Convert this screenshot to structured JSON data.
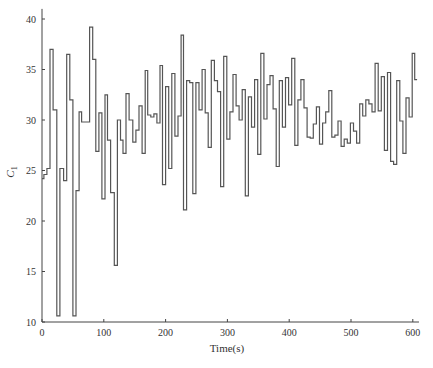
{
  "chart_data": {
    "type": "line",
    "style": "step",
    "title": "",
    "xlabel": "Time(s)",
    "ylabel": "C1",
    "ylabel_main": "C",
    "ylabel_sub": "1",
    "xlim": [
      0,
      610
    ],
    "ylim": [
      10,
      41
    ],
    "xticks": [
      0,
      100,
      200,
      300,
      400,
      500,
      600
    ],
    "yticks": [
      10,
      15,
      20,
      25,
      30,
      35,
      40
    ],
    "grid": false,
    "legend": null,
    "line_color": "#555555",
    "series": [
      {
        "name": "C1",
        "x": [
          0,
          3,
          8,
          13,
          18,
          24,
          29,
          35,
          40,
          45,
          50,
          55,
          60,
          64,
          70,
          77,
          82,
          87,
          92,
          97,
          102,
          106,
          111,
          117,
          122,
          127,
          131,
          136,
          141,
          147,
          152,
          157,
          162,
          167,
          171,
          176,
          181,
          186,
          191,
          195,
          200,
          205,
          210,
          215,
          220,
          225,
          229,
          234,
          239,
          244,
          249,
          254,
          259,
          264,
          269,
          274,
          279,
          284,
          289,
          294,
          299,
          304,
          309,
          314,
          319,
          324,
          329,
          334,
          339,
          344,
          349,
          354,
          359,
          364,
          369,
          374,
          379,
          384,
          389,
          394,
          399,
          404,
          409,
          414,
          419,
          424,
          429,
          434,
          439,
          444,
          449,
          454,
          459,
          464,
          469,
          474,
          479,
          484,
          489,
          494,
          499,
          504,
          509,
          514,
          519,
          524,
          529,
          534,
          539,
          544,
          549,
          554,
          559,
          564,
          569,
          574,
          579,
          584,
          589,
          594,
          599,
          603
        ],
        "values": [
          24.2,
          24.6,
          25.2,
          37.0,
          31.0,
          10.6,
          25.2,
          24.0,
          36.5,
          32.0,
          10.6,
          23.0,
          30.8,
          29.8,
          29.8,
          39.2,
          36.0,
          26.9,
          30.7,
          22.2,
          32.5,
          28.0,
          22.8,
          15.6,
          30.0,
          28.0,
          26.7,
          32.6,
          30.0,
          27.8,
          29.0,
          31.4,
          26.7,
          34.9,
          30.5,
          30.3,
          30.6,
          29.7,
          35.4,
          23.6,
          33.3,
          25.2,
          34.6,
          28.4,
          30.4,
          38.4,
          21.1,
          33.9,
          33.7,
          22.7,
          33.7,
          31.0,
          35.0,
          30.7,
          27.3,
          35.9,
          33.9,
          32.8,
          23.4,
          36.3,
          28.1,
          30.8,
          34.5,
          31.4,
          30.0,
          33.0,
          22.5,
          32.3,
          29.3,
          34.0,
          26.6,
          36.6,
          30.1,
          33.5,
          34.4,
          31.1,
          25.4,
          33.9,
          29.3,
          34.2,
          31.5,
          36.1,
          27.5,
          32.0,
          34.0,
          31.2,
          28.3,
          28.2,
          29.6,
          31.3,
          27.6,
          29.7,
          30.8,
          32.9,
          28.3,
          28.5,
          29.9,
          27.4,
          28.1,
          27.7,
          29.7,
          28.9,
          27.7,
          31.6,
          30.4,
          32.0,
          31.6,
          30.8,
          35.6,
          30.9,
          34.3,
          27.0,
          34.7,
          25.9,
          25.6,
          33.9,
          29.9,
          26.7,
          32.2,
          30.3,
          36.6,
          34.0
        ]
      }
    ]
  }
}
